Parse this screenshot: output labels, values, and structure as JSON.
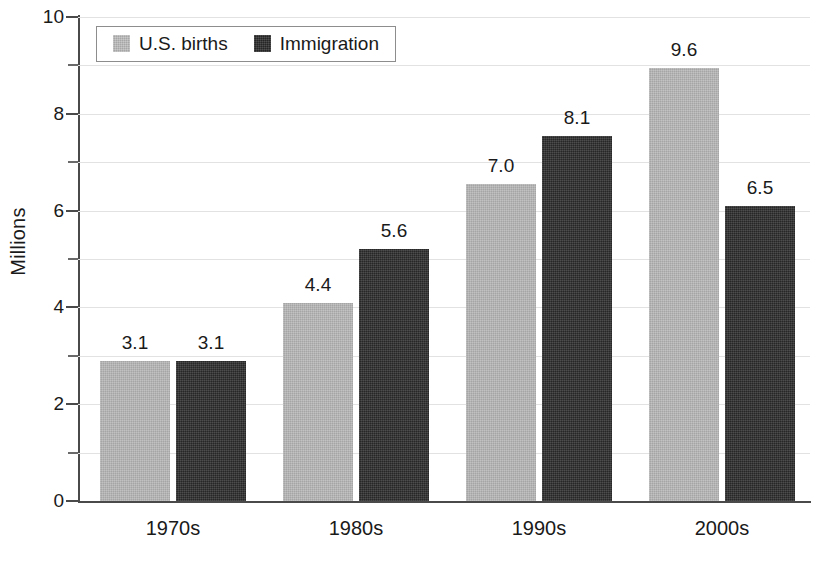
{
  "chart_data": {
    "type": "bar",
    "title": "",
    "subtitle": "",
    "xlabel": "",
    "ylabel": "Millions",
    "categories": [
      "1970s",
      "1980s",
      "1990s",
      "2000s"
    ],
    "series": [
      {
        "name": "U.S. births",
        "color": "#b3b3b3",
        "values": [
          3.1,
          4.4,
          7.0,
          9.6
        ],
        "labels": [
          "3.1",
          "4.4",
          "7.0",
          "9.6"
        ],
        "plotted_heights": [
          2.9,
          4.1,
          6.55,
          8.95
        ]
      },
      {
        "name": "Immigration",
        "color": "#323232",
        "values": [
          3.1,
          5.6,
          8.1,
          6.5
        ],
        "labels": [
          "3.1",
          "5.6",
          "8.1",
          "6.5"
        ],
        "plotted_heights": [
          2.9,
          5.2,
          7.55,
          6.1
        ]
      }
    ],
    "ylim": [
      0,
      10
    ],
    "y_major_ticks": [
      0,
      2,
      4,
      6,
      8,
      10
    ],
    "y_major_tick_labels": [
      "0",
      "2",
      "4",
      "6",
      "8",
      "10"
    ],
    "y_minor_ticks": [
      1,
      3,
      5,
      7,
      9
    ],
    "gridlines": [
      1,
      2,
      3,
      4,
      5,
      6,
      7,
      8,
      9,
      10
    ],
    "grid": true,
    "legend_position": "top-left",
    "legend_entries": [
      "U.S. births",
      "Immigration"
    ]
  }
}
